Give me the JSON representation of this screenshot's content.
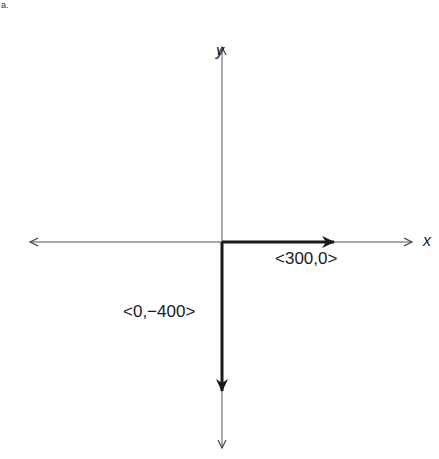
{
  "diagram": {
    "corner_mark": "a.",
    "axes": {
      "x_label": "x",
      "y_label": "y",
      "origin": [
        222,
        242
      ],
      "x_extent": [
        28,
        414
      ],
      "y_extent": [
        45,
        450
      ]
    },
    "vectors": [
      {
        "label": "<300,0>",
        "components": [
          300,
          0
        ],
        "from": [
          222,
          242
        ],
        "to": [
          335,
          242
        ]
      },
      {
        "label": "<0,−400>",
        "components": [
          0,
          -400
        ],
        "from": [
          222,
          242
        ],
        "to": [
          222,
          392
        ]
      }
    ],
    "colors": {
      "ink": "#1a1a1a",
      "axis": "#555555",
      "background": "#ffffff"
    }
  }
}
